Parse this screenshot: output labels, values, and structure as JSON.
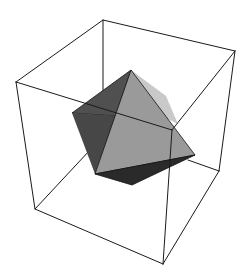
{
  "figure": {
    "background": "#ffffff",
    "box": {
      "stroke": "#1a1a1a",
      "stroke_width": 1,
      "vertices": {
        "back_top": [
          103,
          20
        ],
        "left_top": [
          16,
          82
        ],
        "right_top": [
          235,
          51
        ],
        "front_top": [
          172,
          130
        ],
        "left_bottom": [
          35,
          209
        ],
        "front_bottom": [
          163,
          264
        ],
        "right_bottom": [
          219,
          171
        ],
        "back_bottom": [
          118,
          142
        ]
      }
    },
    "octahedron": {
      "vertices": {
        "top": [
          131,
          70
        ],
        "left": [
          72,
          113
        ],
        "right": [
          195,
          155
        ],
        "bottom_left": [
          95,
          174
        ],
        "bottom": [
          132,
          185
        ]
      },
      "faces": [
        {
          "name": "upper-left-face",
          "points": "131,70 72,113 115,116",
          "fill": "#505050"
        },
        {
          "name": "lower-left-face",
          "points": "72,113 115,116 95,174",
          "fill": "#474747"
        },
        {
          "name": "top-right-highlight-face",
          "points": "131,70 164,94 178,124 160,120",
          "fill": "#c8c8c8"
        },
        {
          "name": "front-face",
          "points": "131,70 95,174 195,155",
          "fill": "#999999"
        },
        {
          "name": "bottom-face",
          "points": "95,174 132,185 195,155",
          "fill": "#2a2a2a"
        }
      ],
      "edge_stroke": "#111111"
    }
  }
}
